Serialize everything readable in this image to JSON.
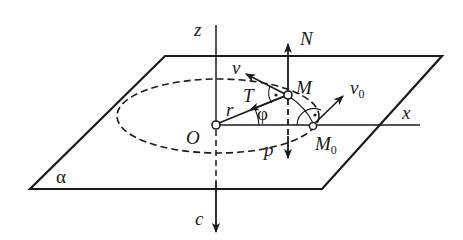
{
  "diagram": {
    "type": "mechanics-motion-on-inclined-plane",
    "plane_label": "α",
    "axes": {
      "z": "z",
      "x": "x"
    },
    "points": {
      "origin": "O",
      "moving_point": "M",
      "initial_point": "M",
      "initial_point_sub": "0"
    },
    "vectors": {
      "normal_force": "N",
      "velocity": "v",
      "initial_velocity": "v",
      "initial_velocity_sub": "0",
      "tension": "T",
      "radius": "r",
      "weight": "p",
      "force_c": "c"
    },
    "angle_label": "φ",
    "colors": {
      "stroke": "#1a1a1a",
      "background": "#ffffff"
    }
  }
}
